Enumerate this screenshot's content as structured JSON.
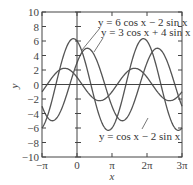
{
  "chart_data": {
    "type": "line",
    "title": "",
    "xlabel": "x",
    "ylabel": "y",
    "xlim": [
      -3.14159,
      9.42478
    ],
    "ylim": [
      -10,
      10
    ],
    "grid": false,
    "x_ticks": [
      {
        "value": -3.14159,
        "label": "−π"
      },
      {
        "value": 0,
        "label": "0"
      },
      {
        "value": 3.14159,
        "label": "π"
      },
      {
        "value": 6.28319,
        "label": "2π"
      },
      {
        "value": 9.42478,
        "label": "3π"
      }
    ],
    "y_ticks": [
      10,
      8,
      6,
      4,
      2,
      0,
      -2,
      -4,
      -6,
      -8,
      -10
    ],
    "y_tick_labels": [
      "10",
      "8",
      "6",
      "4",
      "2",
      "0",
      "−2",
      "−4",
      "−6",
      "−8",
      "−10"
    ],
    "series": [
      {
        "name": "y = 6 cos x − 2 sin x",
        "a": 6,
        "b": -2,
        "amplitude": 6.32
      },
      {
        "name": "y = 3 cos x + 4 sin x",
        "a": 3,
        "b": 4,
        "amplitude": 5
      },
      {
        "name": "y = cos x − 2 sin x",
        "a": 1,
        "b": -2,
        "amplitude": 2.24
      }
    ],
    "annotations": [
      {
        "text": "y = 6 cos x − 2 sin x",
        "position": "top-right"
      },
      {
        "text": "y = 3 cos x + 4 sin x",
        "position": "top-right, below first"
      },
      {
        "text": "y = cos x − 2 sin x",
        "position": "bottom-center"
      }
    ],
    "legend": "none (inline curve labels with leader lines)"
  },
  "colors": {
    "curve": "#555555",
    "axis": "#444444"
  }
}
